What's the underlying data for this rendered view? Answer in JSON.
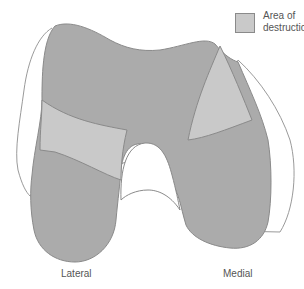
{
  "legend": {
    "label": "Area of destruction",
    "swatch_color": "#c9c9c9"
  },
  "labels": {
    "lateral": "Lateral",
    "medial": "Medial"
  },
  "colors": {
    "bone_fill": "#ababab",
    "destruction_fill": "#c9c9c9",
    "outline": "#8a8a8a",
    "original_outline": "#9a9a9a",
    "background": "#ffffff"
  }
}
